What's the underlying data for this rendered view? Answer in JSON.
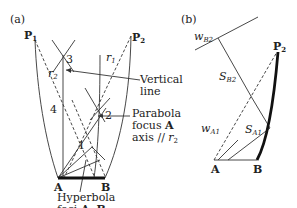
{
  "panel_a": {
    "label": "(a)",
    "points": {
      "P1": "P",
      "P1_sub": "1",
      "P2": "P",
      "P2_sub": "2",
      "A": "A",
      "B": "B"
    },
    "rays": {
      "r1": "r",
      "r1_sub": "1",
      "r2": "r",
      "r2_sub": "2"
    },
    "regions": [
      "1",
      "2",
      "3",
      "4"
    ],
    "annotations": {
      "vertical_line": [
        "Vertical",
        "line"
      ],
      "parabola": [
        "Parabola",
        "focus ",
        "A",
        "axis // ",
        "r",
        "2"
      ],
      "hyperbola": [
        "Hyperbola",
        "foci ",
        "A",
        ", ",
        "B"
      ]
    }
  },
  "panel_b": {
    "label": "(b)",
    "points": {
      "P2": "P",
      "P2_sub": "2",
      "A": "A",
      "B": "B"
    },
    "symbols": {
      "wB2": "w",
      "wB2_sub": "B2",
      "SB2": "S",
      "SB2_sub": "B2",
      "wA1": "w",
      "wA1_sub": "A1",
      "SA1": "S",
      "SA1_sub": "A1"
    }
  }
}
